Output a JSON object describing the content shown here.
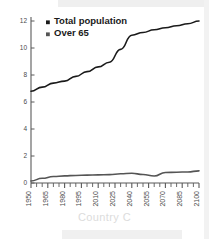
{
  "caption": "Country C",
  "legend": [
    {
      "label": "Total population",
      "marker": "square-marker",
      "color": "#1a1a1a"
    },
    {
      "label": "Over 65",
      "marker": "square-marker",
      "color": "#555555"
    }
  ],
  "chart_data": {
    "type": "line",
    "title": "",
    "subtitle": "Country C",
    "xlabel": "",
    "ylabel": "",
    "xlim": [
      1950,
      2100
    ],
    "ylim": [
      0,
      12
    ],
    "yticks": [
      0,
      2,
      4,
      6,
      8,
      10,
      12
    ],
    "xticks": [
      1950,
      1965,
      1980,
      1995,
      2010,
      2025,
      2040,
      2055,
      2070,
      2085,
      2100
    ],
    "minor_tick_interval": 5,
    "grid": false,
    "legend_position": "top-left",
    "x": [
      1950,
      1960,
      1970,
      1980,
      1990,
      2000,
      2010,
      2020,
      2030,
      2040,
      2050,
      2060,
      2070,
      2080,
      2090,
      2100
    ],
    "series": [
      {
        "name": "Total population",
        "color": "#1a1a1a",
        "values": [
          6.8,
          7.1,
          7.4,
          7.55,
          7.9,
          8.25,
          8.6,
          8.95,
          9.9,
          10.95,
          11.15,
          11.35,
          11.5,
          11.65,
          11.8,
          12.0
        ]
      },
      {
        "name": "Over 65",
        "color": "#555555",
        "values": [
          0.15,
          0.35,
          0.48,
          0.53,
          0.56,
          0.58,
          0.6,
          0.62,
          0.68,
          0.72,
          0.63,
          0.52,
          0.78,
          0.8,
          0.82,
          0.9
        ]
      }
    ]
  },
  "axis": {
    "ytick_labels": [
      "0",
      "2",
      "4",
      "6",
      "8",
      "10",
      "12"
    ],
    "xtick_labels": [
      "1950",
      "1965",
      "1980",
      "1995",
      "2010",
      "2025",
      "2040",
      "2055",
      "2070",
      "2085",
      "2100"
    ]
  }
}
